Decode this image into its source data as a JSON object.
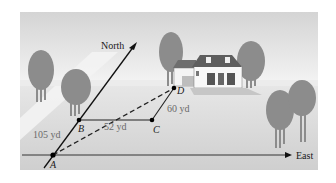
{
  "diagram": {
    "axes": {
      "north_label": "North",
      "east_label": "East"
    },
    "points": [
      {
        "id": "A",
        "label": "A"
      },
      {
        "id": "B",
        "label": "B"
      },
      {
        "id": "C",
        "label": "C"
      },
      {
        "id": "D",
        "label": "D"
      }
    ],
    "distances": {
      "AB": "105 yd",
      "BC": "52 yd",
      "CD": "60 yd"
    },
    "colors": {
      "background": "#ffffff",
      "ground": "#d9d9d9",
      "sky": "#e6e6e6",
      "path": "#f0f0f0",
      "trees": "#8c8c8c",
      "lines": "#111111"
    }
  }
}
